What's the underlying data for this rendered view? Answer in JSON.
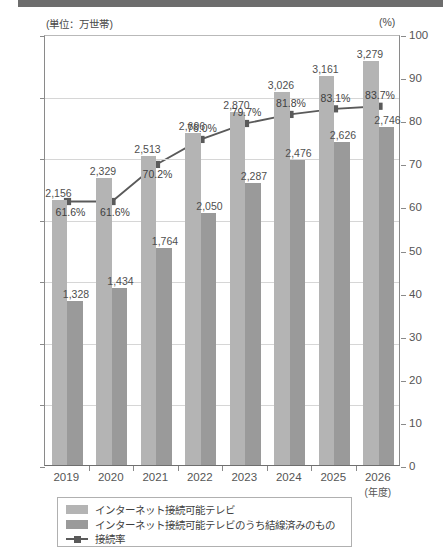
{
  "banner": {
    "present": true,
    "color": "#6d6d6d"
  },
  "axis_units": {
    "left": "(単位：万世帯)",
    "right": "(%)"
  },
  "colors": {
    "series1_bar": "#b4b4b4",
    "series2_bar": "#9a9a9a",
    "line": "#5a5a5a",
    "grid": "#d6d6d6",
    "axis": "#8a8a8a"
  },
  "legend": {
    "items": [
      {
        "label": "インターネット接続可能テレビ",
        "marker": "swatch-light"
      },
      {
        "label": "インターネット接続可能テレビのうち結線済みのもの",
        "marker": "swatch-dark"
      },
      {
        "label": "接続率",
        "marker": "line-square"
      }
    ]
  },
  "chart_data": {
    "type": "bar",
    "title": "",
    "xlabel": "(年度)",
    "ylabel": "(単位：万世帯)",
    "y2label": "(%)",
    "ylim": [
      0,
      3500
    ],
    "y2lim": [
      0,
      100
    ],
    "yticks": [
      "0",
      "500",
      "1,000",
      "1,500",
      "2,000",
      "2,500",
      "3,000",
      "3,500"
    ],
    "ytick_values": [
      0,
      500,
      1000,
      1500,
      2000,
      2500,
      3000,
      3500
    ],
    "y2ticks": [
      "0",
      "10",
      "20",
      "30",
      "40",
      "50",
      "60",
      "70",
      "80",
      "90",
      "100"
    ],
    "y2tick_values": [
      0,
      10,
      20,
      30,
      40,
      50,
      60,
      70,
      80,
      90,
      100
    ],
    "grid": true,
    "legend_position": "bottom",
    "categories": [
      "2019",
      "2020",
      "2021",
      "2022",
      "2023",
      "2024",
      "2025",
      "2026"
    ],
    "category_sub": [
      "",
      "",
      "",
      "",
      "",
      "",
      "",
      "(年度)"
    ],
    "series": [
      {
        "name": "インターネット接続可能テレビ",
        "type": "bar",
        "axis": "left",
        "values": [
          2156,
          2329,
          2513,
          2696,
          2870,
          3026,
          3161,
          3279
        ],
        "labels": [
          "2,156",
          "2,329",
          "2,513",
          "2,696",
          "2,870",
          "3,026",
          "3,161",
          "3,279"
        ]
      },
      {
        "name": "インターネット接続可能テレビのうち結線済みのもの",
        "type": "bar",
        "axis": "left",
        "values": [
          1328,
          1434,
          1764,
          2050,
          2287,
          2476,
          2626,
          2746
        ],
        "labels": [
          "1,328",
          "1,434",
          "1,764",
          "2,050",
          "2,287",
          "2,476",
          "2,626",
          "2,746"
        ]
      },
      {
        "name": "接続率",
        "type": "line",
        "axis": "right",
        "values": [
          61.6,
          61.6,
          70.2,
          76.0,
          79.7,
          81.8,
          83.1,
          83.7
        ],
        "labels": [
          "61.6%",
          "61.6%",
          "70.2%",
          "76.0%",
          "79.7%",
          "81.8%",
          "83.1%",
          "83.7%"
        ]
      }
    ]
  }
}
